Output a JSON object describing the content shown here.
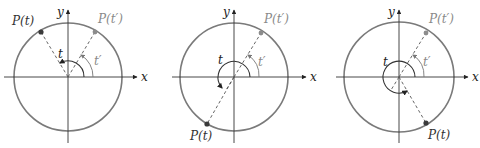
{
  "colors": {
    "circle": "#7a7a7a",
    "axis": "#333333",
    "dashed": "#555555",
    "arc": "#333333",
    "point_t": "#3a3a3a",
    "point_tprime": "#8c8c8c",
    "label_t": "#333333",
    "label_tprime": "#8a8a8a"
  },
  "diagrams": [
    {
      "center": [
        68,
        77
      ],
      "radius": 54,
      "axis_x_end": 137,
      "axis_x_start": 4,
      "axis_y_top": 10,
      "axis_y_bottom": 143,
      "x_label": "x",
      "y_label": "y",
      "point_t": {
        "label": "P(t)",
        "x": 41,
        "y": 32,
        "label_x": 12,
        "label_y": 25
      },
      "point_tprime": {
        "label": "P(t′)",
        "x": 95,
        "y": 32,
        "label_x": 98,
        "label_y": 23
      },
      "angle_t_label": "t",
      "angle_t_label_pos": [
        58,
        58
      ],
      "angle_tprime_label": "t′",
      "angle_tprime_label_pos": [
        94,
        65
      ],
      "t_arc": "M 84 77 A 16 16 0 0 0 60 63",
      "t_arrow": [
        60,
        63,
        58,
        62
      ],
      "tprime_arc": "M 93 77 A 25 25 0 0 0 81 55",
      "tprime_arrow": [
        81,
        55,
        80,
        53
      ]
    },
    {
      "center": [
        234,
        77
      ],
      "radius": 54,
      "axis_x_end": 306,
      "axis_x_start": 172,
      "axis_y_top": 10,
      "axis_y_bottom": 143,
      "x_label": "x",
      "y_label": "y",
      "point_t": {
        "label": "P(t)",
        "x": 207,
        "y": 124,
        "label_x": 190,
        "label_y": 140
      },
      "point_tprime": {
        "label": "P(t′)",
        "x": 261,
        "y": 33,
        "label_x": 264,
        "label_y": 23
      },
      "angle_t_label": "t",
      "angle_t_label_pos": [
        218,
        64
      ],
      "angle_tprime_label": "t′",
      "angle_tprime_label_pos": [
        258,
        66
      ],
      "t_arc": "M 250 77 A 16 16 0 1 0 222 88",
      "t_arrow": [
        222,
        88,
        220,
        87
      ],
      "tprime_arc": "M 259 77 A 25 25 0 0 0 248 55",
      "tprime_arrow": [
        248,
        55,
        247,
        53
      ]
    },
    {
      "center": [
        399,
        77
      ],
      "radius": 55,
      "axis_x_end": 468,
      "axis_x_start": 336,
      "axis_y_top": 10,
      "axis_y_bottom": 143,
      "x_label": "x",
      "y_label": "y",
      "point_t": {
        "label": "P(t)",
        "x": 426,
        "y": 123,
        "label_x": 428,
        "label_y": 139
      },
      "point_tprime": {
        "label": "P(t′)",
        "x": 426,
        "y": 33,
        "label_x": 429,
        "label_y": 23
      },
      "angle_t_label": "t",
      "angle_t_label_pos": [
        383,
        66
      ],
      "angle_tprime_label": "t′",
      "angle_tprime_label_pos": [
        423,
        66
      ],
      "t_arc": "M 415 77 A 16 16 0 1 0 407 91",
      "t_arrow": [
        407,
        91,
        409,
        90
      ],
      "tprime_arc": "M 424 77 A 25 25 0 0 0 413 55",
      "tprime_arrow": [
        413,
        55,
        412,
        53
      ]
    }
  ]
}
